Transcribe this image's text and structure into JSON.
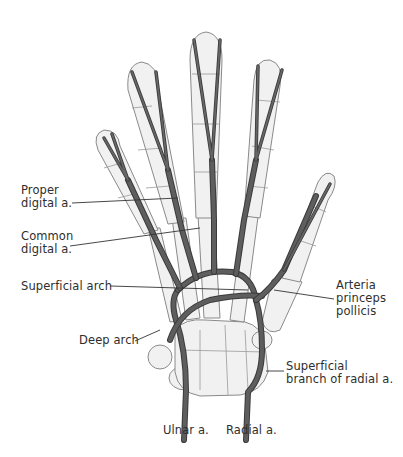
{
  "figure": {
    "colors": {
      "artery": "#3a3a3a",
      "artery_fill": "#5e5e5e",
      "bone": "#f1f1f1",
      "outline": "#8a8a8a",
      "text": "#2e2e2e"
    }
  },
  "labels": {
    "proper_digital": [
      "Proper",
      "digital a."
    ],
    "common_digital": [
      "Common",
      "digital a."
    ],
    "superficial_arch": "Superficial arch",
    "deep_arch": "Deep arch",
    "arteria_princeps_pollicis": [
      "Arteria",
      "princeps",
      "pollicis"
    ],
    "superficial_branch_radial": [
      "Superficial",
      "branch of radial a."
    ],
    "ulnar": "Ulnar a.",
    "radial": "Radial a."
  }
}
